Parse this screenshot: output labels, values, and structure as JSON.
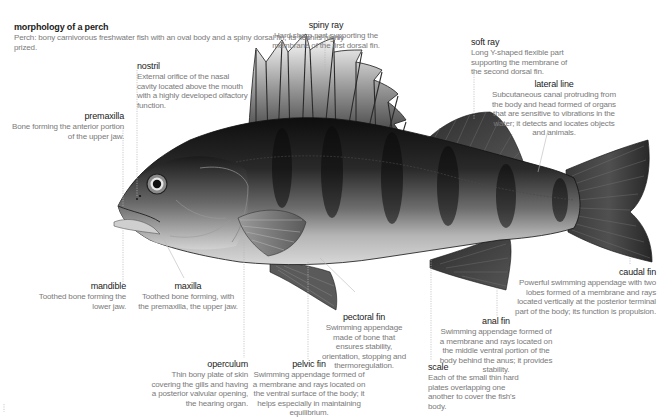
{
  "title": {
    "heading": "morphology of a perch",
    "description": "Perch: bony carnivorous freshwater fish with an oval body and a spiny dorsal fin; its flesh is highly prized."
  },
  "labels": {
    "spiny_ray": {
      "name": "spiny ray",
      "desc": "Hard sharp part supporting the membrane of the first dorsal fin."
    },
    "soft_ray": {
      "name": "soft ray",
      "desc": "Long Y-shaped flexible part supporting the membrane of the second dorsal fin."
    },
    "nostril": {
      "name": "nostril",
      "desc": "External orifice of the nasal cavity located above the mouth with a highly developed olfactory function."
    },
    "lateral_line": {
      "name": "lateral line",
      "desc": "Subcutaneous canal protruding from the body and head formed of organs that are sensitive to vibrations in the water; it detects and locates objects and animals."
    },
    "premaxilla": {
      "name": "premaxilla",
      "desc": "Bone forming the anterior portion of the upper jaw."
    },
    "caudal_fin": {
      "name": "caudal fin",
      "desc": "Powerful swimming appendage with two lobes formed of a membrane and rays located vertically at the posterior terminal part of the body; its function is propulsion."
    },
    "mandible": {
      "name": "mandible",
      "desc": "Toothed bone forming the lower jaw."
    },
    "maxilla": {
      "name": "maxilla",
      "desc": "Toothed bone forming, with the premaxilla, the upper jaw."
    },
    "pectoral_fin": {
      "name": "pectoral fin",
      "desc": "Swimming appendage made of bone that ensures stability, orientation, stopping and thermoregulation."
    },
    "anal_fin": {
      "name": "anal fin",
      "desc": "Swimming appendage formed of a membrane and rays located on the middle ventral portion of the body behind the anus; it provides stability."
    },
    "operculum": {
      "name": "operculum",
      "desc": "Thin bony plate of skin covering the gills and having a posterior valvular opening, the hearing organ."
    },
    "pelvic_fin": {
      "name": "pelvic fin",
      "desc": "Swimming appendage formed of a membrane and rays located on the ventral surface of the body; it helps especially in maintaining equilibrium."
    },
    "scale": {
      "name": "scale",
      "desc": "Each of the small thin hard plates overlapping one another to cover the fish's body."
    }
  },
  "colors": {
    "body_dark": "#1c1c1c",
    "body_light": "#bdbdbd",
    "belly": "#d6d6d6",
    "fin": "#4a4a4a",
    "label_title": "#1a1a1a",
    "label_text": "#7a7a7a",
    "leader_line": "#b5b5b5"
  }
}
